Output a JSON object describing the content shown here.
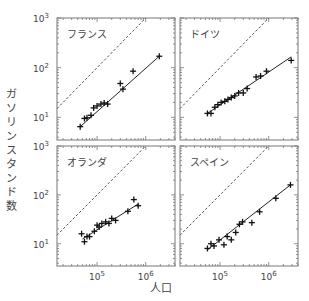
{
  "chart_data": [
    {
      "type": "scatter",
      "title": "フランス",
      "xlabel": "人口",
      "ylabel": "ガソリンスタンド数",
      "xscale": "log",
      "yscale": "log",
      "xlim": [
        15000,
        4000000
      ],
      "ylim": [
        3.5,
        1000
      ],
      "reference_line": "y = x/1000 (dashed)",
      "points": [
        [
          45000,
          6.5
        ],
        [
          55000,
          9.5
        ],
        [
          62000,
          9.8
        ],
        [
          75000,
          11
        ],
        [
          85000,
          15.5
        ],
        [
          100000,
          17
        ],
        [
          120000,
          18.5
        ],
        [
          140000,
          19.5
        ],
        [
          165000,
          18.5
        ],
        [
          300000,
          48
        ],
        [
          340000,
          37
        ],
        [
          550000,
          85
        ],
        [
          1900000,
          170
        ]
      ],
      "fit": [
        [
          45000,
          6.5
        ],
        [
          1900000,
          170
        ]
      ]
    },
    {
      "type": "scatter",
      "title": "ドイツ",
      "xlabel": "人口",
      "ylabel": "ガソリンスタンド数",
      "xscale": "log",
      "yscale": "log",
      "xlim": [
        15000,
        4000000
      ],
      "ylim": [
        3.5,
        1000
      ],
      "reference_line": "y = x/1000 (dashed)",
      "points": [
        [
          55000,
          12
        ],
        [
          65000,
          12
        ],
        [
          78000,
          16
        ],
        [
          90000,
          18
        ],
        [
          105000,
          20
        ],
        [
          125000,
          21
        ],
        [
          145000,
          23
        ],
        [
          170000,
          25
        ],
        [
          200000,
          27
        ],
        [
          240000,
          31
        ],
        [
          300000,
          31
        ],
        [
          360000,
          38
        ],
        [
          550000,
          65
        ],
        [
          680000,
          68
        ],
        [
          900000,
          85
        ],
        [
          2900000,
          140
        ]
      ],
      "fit": [
        [
          55000,
          12
        ],
        [
          2900000,
          165
        ]
      ]
    },
    {
      "type": "scatter",
      "title": "オランダ",
      "xlabel": "人口",
      "ylabel": "ガソリンスタンド数",
      "xscale": "log",
      "yscale": "log",
      "xlim": [
        15000,
        4000000
      ],
      "ylim": [
        3.5,
        1000
      ],
      "reference_line": "y = x/1000 (dashed)",
      "points": [
        [
          48000,
          16
        ],
        [
          55000,
          11
        ],
        [
          62000,
          14
        ],
        [
          70000,
          14
        ],
        [
          88000,
          18
        ],
        [
          100000,
          24
        ],
        [
          110000,
          22
        ],
        [
          125000,
          26
        ],
        [
          150000,
          28
        ],
        [
          175000,
          26
        ],
        [
          200000,
          33
        ],
        [
          240000,
          30
        ],
        [
          430000,
          46
        ],
        [
          570000,
          80
        ],
        [
          700000,
          60
        ]
      ],
      "fit": [
        [
          50000,
          12.5
        ],
        [
          700000,
          65
        ]
      ]
    },
    {
      "type": "scatter",
      "title": "スペイン",
      "xlabel": "人口",
      "ylabel": "ガソリンスタンド数",
      "xscale": "log",
      "yscale": "log",
      "xlim": [
        15000,
        4000000
      ],
      "ylim": [
        3.5,
        1000
      ],
      "reference_line": "y = x/1000 (dashed)",
      "points": [
        [
          55000,
          8
        ],
        [
          65000,
          10
        ],
        [
          75000,
          9
        ],
        [
          95000,
          12
        ],
        [
          120000,
          9.5
        ],
        [
          140000,
          14
        ],
        [
          170000,
          12
        ],
        [
          210000,
          17
        ],
        [
          250000,
          25
        ],
        [
          290000,
          28
        ],
        [
          450000,
          27
        ],
        [
          650000,
          45
        ],
        [
          1400000,
          85
        ],
        [
          2800000,
          160
        ]
      ],
      "fit": [
        [
          55000,
          7.5
        ],
        [
          2800000,
          160
        ]
      ]
    }
  ],
  "axes": {
    "ylabel": "ガソリンスタンド数",
    "xlabel": "人口",
    "ytick_labels": [
      {
        "text": "10",
        "sup": "3",
        "exp": 3
      },
      {
        "text": "10",
        "sup": "2",
        "exp": 2
      },
      {
        "text": "10",
        "sup": "1",
        "exp": 1
      }
    ],
    "xtick_labels": [
      {
        "text": "10",
        "sup": "5",
        "exp": 5
      },
      {
        "text": "10",
        "sup": "6",
        "exp": 6
      }
    ]
  }
}
